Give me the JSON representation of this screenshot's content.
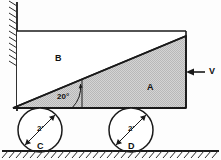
{
  "figure": {
    "labels": {
      "block_a": "A",
      "block_b": "B",
      "wheel_c": "C",
      "wheel_d": "D",
      "angle": "20°",
      "wheel_c_diameter": "2'",
      "wheel_d_diameter": "2'",
      "force": "V"
    },
    "colors": {
      "wedge_fill": "#c9c9c9",
      "outline": "#1a1a1a",
      "background": "#fdfdfd",
      "hatch": "#333333"
    },
    "geometry": {
      "angle_degrees": 20,
      "wheel_diameter_feet": 2,
      "wall_x": 17,
      "top_y": 31,
      "base_y": 108,
      "right_x": 186,
      "wedge_tip_x": 13,
      "wheel_c_center": [
        40,
        130
      ],
      "wheel_d_center": [
        131,
        130
      ],
      "wheel_radius": 22,
      "ground_y": 151
    }
  }
}
